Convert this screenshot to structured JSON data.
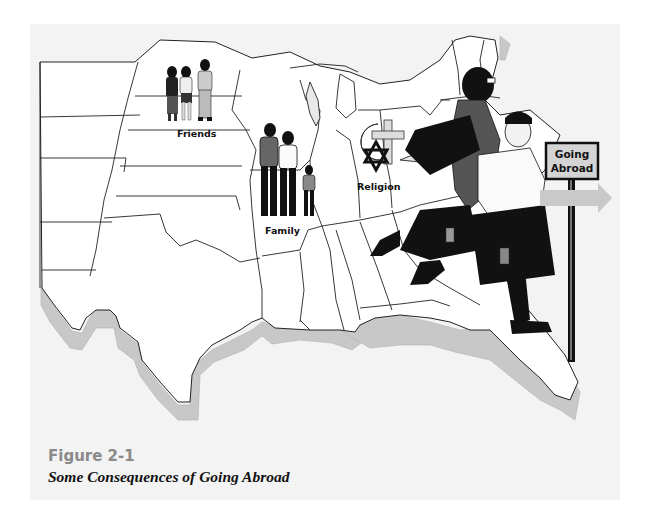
{
  "figure": {
    "number": "Figure 2-1",
    "title": "Some Consequences of Going Abroad"
  },
  "map": {
    "labels": {
      "friends": "Friends",
      "family": "Family",
      "religion": "Religion"
    },
    "sign": {
      "line1": "Going",
      "line2": "Abroad"
    }
  },
  "colors": {
    "panel_bg": "#f3f3f3",
    "map_fill": "#ffffff",
    "extrusion": "#c8c8c8",
    "outline": "#222222",
    "arrow": "#c9c9c9",
    "caption_number": "#8a8a8a"
  }
}
